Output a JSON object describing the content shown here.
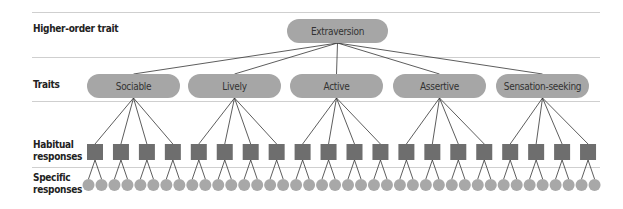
{
  "diagram": {
    "type": "hierarchy",
    "levels": [
      {
        "label": "Higher-order trait"
      },
      {
        "label": "Traits"
      },
      {
        "label": "Habitual responses"
      },
      {
        "label": "Specific responses"
      }
    ],
    "level_labels": {
      "higher_order": "Higher-order trait",
      "traits": "Traits",
      "habitual_line1": "Habitual",
      "habitual_line2": "responses",
      "specific_line1": "Specific",
      "specific_line2": "responses"
    },
    "root": {
      "label": "Extraversion"
    },
    "traits": [
      {
        "label": "Sociable",
        "habitual_count": 4
      },
      {
        "label": "Lively",
        "habitual_count": 4
      },
      {
        "label": "Active",
        "habitual_count": 4
      },
      {
        "label": "Assertive",
        "habitual_count": 4
      },
      {
        "label": "Sensation-seeking",
        "habitual_count": 4
      }
    ],
    "specific_per_habitual": 2,
    "colors": {
      "node_fill": "#a6a6a6",
      "square_fill": "#6e6e6e",
      "circle_fill": "#a8a8a8",
      "line": "#333333",
      "divider": "#cfcfcf"
    }
  }
}
